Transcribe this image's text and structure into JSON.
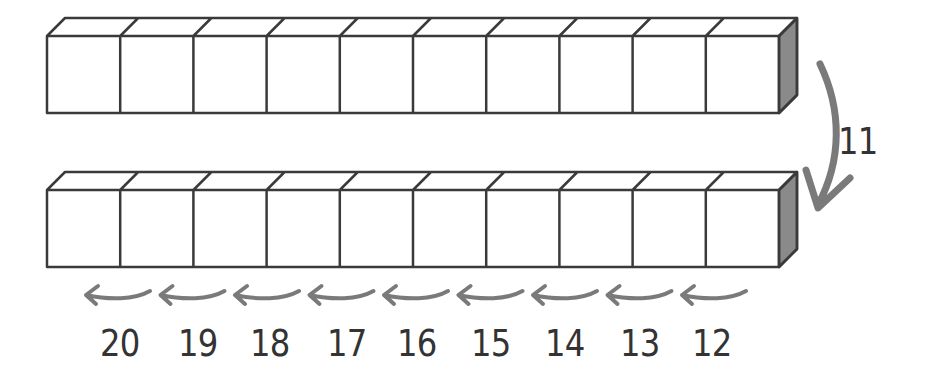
{
  "diagram": {
    "colors": {
      "stroke": "#3a3a3a",
      "side_shade": "#8a8a8a",
      "arrow": "#7a7a7a",
      "text": "#333333"
    },
    "rods": [
      {
        "name": "top-rod",
        "cubes": 10
      },
      {
        "name": "bottom-rod",
        "cubes": 10
      }
    ],
    "transition_label": "11",
    "count_labels": [
      "20",
      "19",
      "18",
      "17",
      "16",
      "15",
      "14",
      "13",
      "12"
    ]
  }
}
